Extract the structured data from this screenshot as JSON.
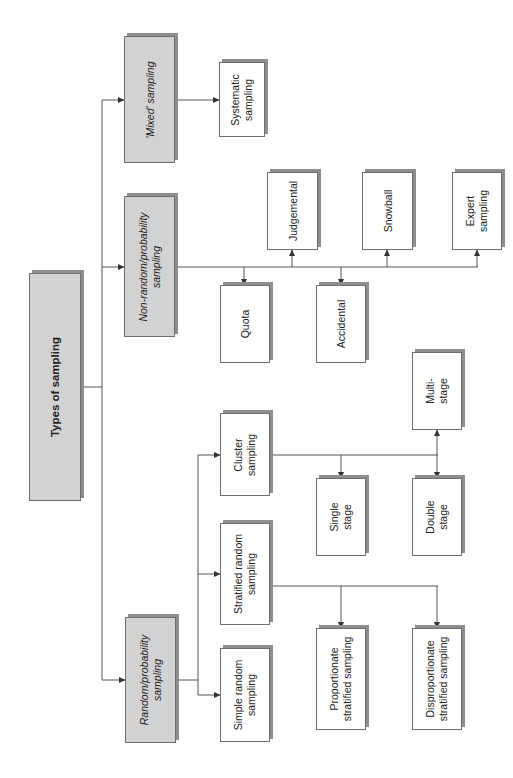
{
  "diagram": {
    "title": "Types of sampling",
    "nodes": [
      {
        "id": "root",
        "label": "Types of sampling",
        "style": "gray",
        "x": 29,
        "y": 273,
        "w": 52,
        "h": 228
      },
      {
        "id": "mixed",
        "label": "'Mixed' sampling",
        "style": "gray",
        "x": 124,
        "y": 36,
        "w": 51,
        "h": 127
      },
      {
        "id": "nonrandom",
        "label": "Non-random/probability\nsampling",
        "style": "gray",
        "x": 124,
        "y": 196,
        "w": 51,
        "h": 141
      },
      {
        "id": "random",
        "label": "Random/probability\nsampling",
        "style": "gray",
        "x": 125,
        "y": 617,
        "w": 51,
        "h": 126
      },
      {
        "id": "systematic",
        "label": "Systematic\nsampling",
        "style": "white",
        "x": 219,
        "y": 62,
        "w": 46,
        "h": 75
      },
      {
        "id": "judgemental",
        "label": "Judgemental",
        "style": "white",
        "x": 267,
        "y": 172,
        "w": 51,
        "h": 78
      },
      {
        "id": "snowball",
        "label": "Snowball",
        "style": "white",
        "x": 362,
        "y": 172,
        "w": 51,
        "h": 78
      },
      {
        "id": "expert",
        "label": "Expert\nsampling",
        "style": "white",
        "x": 452,
        "y": 172,
        "w": 50,
        "h": 78
      },
      {
        "id": "quota",
        "label": "Quota",
        "style": "white",
        "x": 220,
        "y": 285,
        "w": 50,
        "h": 78
      },
      {
        "id": "accidental",
        "label": "Accidental",
        "style": "white",
        "x": 316,
        "y": 285,
        "w": 50,
        "h": 78
      },
      {
        "id": "cluster",
        "label": "Cluster\nsampling",
        "style": "white",
        "x": 220,
        "y": 413,
        "w": 50,
        "h": 83
      },
      {
        "id": "multistage",
        "label": "Multi-\nstage",
        "style": "white",
        "x": 412,
        "y": 352,
        "w": 50,
        "h": 78
      },
      {
        "id": "singlestage",
        "label": "Single\nstage",
        "style": "white",
        "x": 316,
        "y": 478,
        "w": 50,
        "h": 78
      },
      {
        "id": "doublestage",
        "label": "Double\nstage",
        "style": "white",
        "x": 412,
        "y": 478,
        "w": 50,
        "h": 78
      },
      {
        "id": "stratified",
        "label": "Stratified random\nsampling",
        "style": "white",
        "x": 220,
        "y": 523,
        "w": 50,
        "h": 102
      },
      {
        "id": "simple",
        "label": "Simple random\nsampling",
        "style": "white",
        "x": 220,
        "y": 648,
        "w": 50,
        "h": 94
      },
      {
        "id": "proportionate",
        "label": "Proportionate\nstratified sampling",
        "style": "white",
        "x": 316,
        "y": 628,
        "w": 50,
        "h": 102
      },
      {
        "id": "disproportionate",
        "label": "Disproportionate\nstratified sampling",
        "style": "white",
        "x": 412,
        "y": 628,
        "w": 50,
        "h": 102
      }
    ],
    "edges": [
      [
        "root",
        "mixed"
      ],
      [
        "root",
        "nonrandom"
      ],
      [
        "root",
        "random"
      ],
      [
        "mixed",
        "systematic"
      ],
      [
        "nonrandom",
        "quota"
      ],
      [
        "nonrandom",
        "judgemental"
      ],
      [
        "nonrandom",
        "accidental"
      ],
      [
        "nonrandom",
        "snowball"
      ],
      [
        "nonrandom",
        "expert"
      ],
      [
        "random",
        "simple"
      ],
      [
        "random",
        "stratified"
      ],
      [
        "random",
        "cluster"
      ],
      [
        "cluster",
        "singlestage"
      ],
      [
        "cluster",
        "doublestage"
      ],
      [
        "cluster",
        "multistage"
      ],
      [
        "stratified",
        "proportionate"
      ],
      [
        "stratified",
        "disproportionate"
      ]
    ],
    "colors": {
      "gray_fill": "#d2d2d2",
      "shadow": "#8e8e8e",
      "line": "#555555",
      "border": "#6f6f6f"
    }
  }
}
